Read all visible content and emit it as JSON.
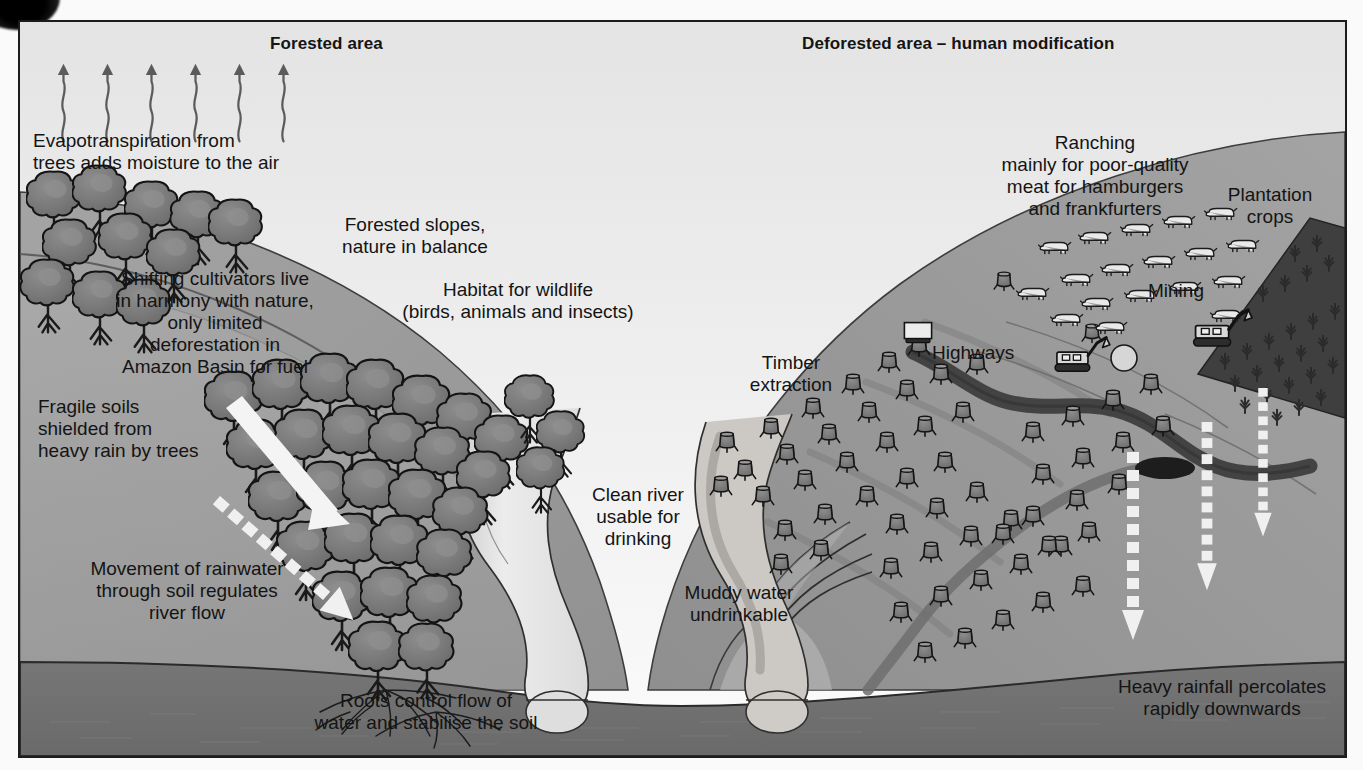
{
  "diagram": {
    "headers": {
      "left": "Forested area",
      "right": "Deforested area – human modification"
    },
    "colors": {
      "sky": "#ededed",
      "frame_border": "#1c1c1c",
      "slope_upper": "#9d9d9d",
      "slope_mid": "#8b8b8b",
      "subsoil": "#a6a6a6",
      "bedrock": "#6e6e6e",
      "river_clean": "#e3e3e3",
      "river_muddy": "#c9c9c9",
      "highway": "#4a4a4a",
      "tree_canopy": "#7d7d7d",
      "plantation": "#4d4d4d",
      "arrow_white": "#f2f2f2",
      "text": "#141414"
    },
    "labels": {
      "evapotranspiration": "Evapotranspiration from\ntrees adds moisture to the air",
      "shifting_cultivators": "Shifting cultivators live\nin harmony with nature,\nonly limited\ndeforestation in\nAmazon Basin for fuel",
      "forested_slopes": "Forested slopes,\nnature in balance",
      "habitat": "Habitat for wildlife\n(birds, animals and insects)",
      "fragile_soils": "Fragile soils\nshielded from\nheavy rain by trees",
      "movement_rainwater": "Movement of rainwater\nthrough soil regulates\nriver flow",
      "roots": "Roots control flow of\nwater and stabilise the soil",
      "clean_river": "Clean river\nusable for\ndrinking",
      "muddy_water": "Muddy water\nundrinkable",
      "timber_extraction": "Timber\nextraction",
      "highways": "Highways",
      "ranching": "Ranching\nmainly for poor-quality\nmeat for hamburgers\nand frankfurters",
      "mining": "Mining",
      "plantation_crops": "Plantation\ncrops",
      "heavy_rainfall": "Heavy rainfall percolates\nrapidly downwards"
    },
    "label_lines": {
      "evapotranspiration": [
        "Evapotranspiration from",
        "trees adds moisture to the air"
      ],
      "shifting_cultivators": [
        "Shifting cultivators live",
        "in harmony with nature,",
        "only limited",
        "deforestation in",
        "Amazon Basin for fuel"
      ],
      "forested_slopes": [
        "Forested slopes,",
        "nature in balance"
      ],
      "habitat": [
        "Habitat for wildlife",
        "(birds, animals and insects)"
      ],
      "fragile_soils": [
        "Fragile soils",
        "shielded from",
        "heavy rain by trees"
      ],
      "movement_rainwater": [
        "Movement of rainwater",
        "through soil regulates",
        "river flow"
      ],
      "roots": [
        "Roots control flow of",
        "water and stabilise the soil"
      ],
      "clean_river": [
        "Clean river",
        "usable for",
        "drinking"
      ],
      "muddy_water": [
        "Muddy water",
        "undrinkable"
      ],
      "timber_extraction": [
        "Timber",
        "extraction"
      ],
      "ranching": [
        "Ranching",
        "mainly for poor-quality",
        "meat for hamburgers",
        "and frankfurters"
      ],
      "plantation_crops": [
        "Plantation",
        "crops"
      ],
      "heavy_rainfall": [
        "Heavy rainfall percolates",
        "rapidly downwards"
      ]
    },
    "icons": {
      "evaporation_arrows": "wavy-up-arrow-icon",
      "tree": "broadleaf-tree-icon",
      "stump": "tree-stump-icon",
      "cattle": "cattle-icon",
      "truck": "truck-icon",
      "excavator": "excavator-icon",
      "roots": "tree-roots-icon",
      "percolation_arrow": "dashed-down-arrow-icon",
      "throughflow_arrow": "solid-down-arrow-icon"
    },
    "counts": {
      "evaporation_arrows": 6,
      "percolation_arrows": 3,
      "cattle": 18,
      "excavators": 2,
      "trucks": 1
    }
  }
}
